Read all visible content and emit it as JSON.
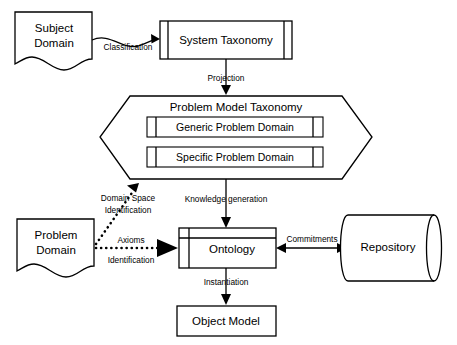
{
  "diagram": {
    "background_color": "#ffffff",
    "stroke_color": "#000000",
    "nodes": {
      "subject_domain": {
        "label_line1": "Subject",
        "label_line2": "Domain",
        "shape": "document"
      },
      "system_taxonomy": {
        "label": "System Taxonomy",
        "shape": "process-box"
      },
      "problem_model_taxonomy": {
        "label": "Problem Model Taxonomy",
        "shape": "hexagon"
      },
      "generic_problem_domain": {
        "label": "Generic Problem Domain",
        "shape": "process-box"
      },
      "specific_problem_domain": {
        "label": "Specific Problem Domain",
        "shape": "process-box"
      },
      "problem_domain": {
        "label_line1": "Problem",
        "label_line2": "Domain",
        "shape": "document"
      },
      "ontology": {
        "label": "Ontology",
        "shape": "component-box"
      },
      "repository": {
        "label": "Repository",
        "shape": "cylinder"
      },
      "object_model": {
        "label": "Object Model",
        "shape": "rectangle"
      }
    },
    "edges": {
      "classification": {
        "label": "Classification",
        "style": "solid-curved",
        "from": "subject_domain",
        "to": "system_taxonomy"
      },
      "projection": {
        "label": "Projection",
        "style": "solid",
        "from": "system_taxonomy",
        "to": "problem_model_taxonomy"
      },
      "domain_space_identification": {
        "label_line1": "Domain Space",
        "label_line2": "Identification",
        "style": "dotted",
        "from": "problem_domain",
        "to": "problem_model_taxonomy"
      },
      "axioms_identification": {
        "label_line1": "Axioms",
        "label_line2": "Identification",
        "style": "dotted",
        "from": "problem_domain",
        "to": "ontology"
      },
      "knowledge_generation": {
        "label": "Knowledge generation",
        "style": "solid",
        "from": "problem_model_taxonomy",
        "to": "ontology"
      },
      "commitments": {
        "label": "Commitments",
        "style": "solid-bidirectional",
        "from": "ontology",
        "to": "repository"
      },
      "instantiation": {
        "label": "Instantiation",
        "style": "solid",
        "from": "ontology",
        "to": "object_model"
      }
    }
  }
}
